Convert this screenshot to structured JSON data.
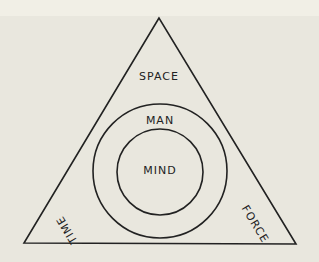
{
  "diagram": {
    "type": "triangle-with-concentric-circles",
    "triangle_labels": {
      "top": "SPACE",
      "bottom_left": "TIME",
      "bottom_right": "FORCE"
    },
    "circles": {
      "outer": "MAN",
      "inner": "MIND"
    },
    "colors": {
      "background": "#e9e7de",
      "stroke": "#222222"
    }
  }
}
